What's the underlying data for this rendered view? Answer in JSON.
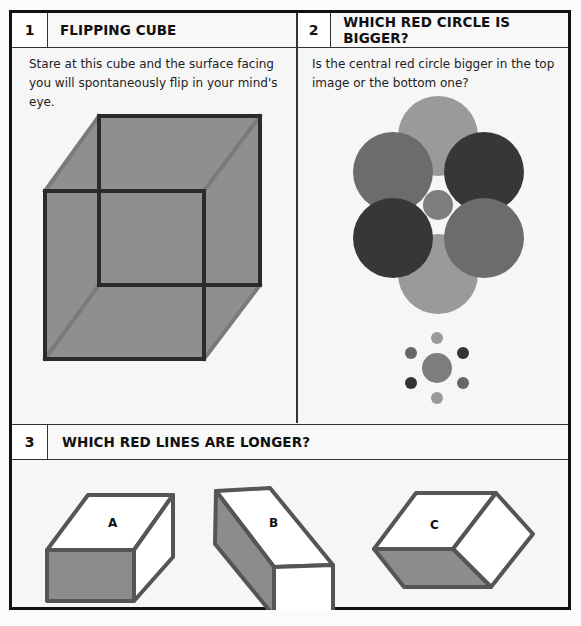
{
  "panels": [
    {
      "number": "1",
      "title": "FLIPPING CUBE",
      "description": "Stare at this cube and the surface facing you will spontaneously flip in your mind's eye."
    },
    {
      "number": "2",
      "title": "WHICH RED CIRCLE IS BIGGER?",
      "description": "Is the central red circle bigger in the top image or the bottom one?"
    },
    {
      "number": "3",
      "title": "WHICH RED LINES ARE LONGER?",
      "boxes": [
        {
          "label": "A"
        },
        {
          "label": "B"
        },
        {
          "label": "C"
        }
      ]
    }
  ],
  "colors": {
    "frame": "#111111",
    "fill_gray": "#8c8c8c",
    "dark_circle": "#3a3a3a",
    "mid_circle": "#6e6e6e",
    "light_circle": "#999999"
  }
}
